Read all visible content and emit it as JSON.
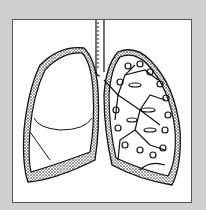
{
  "figure": {
    "left_lung": "collapsed lung outline",
    "right_lung": "lung with bronchial tree",
    "colors": {
      "background": "#cfcfcf",
      "panel": "#ffffff",
      "ink": "#111111"
    }
  }
}
